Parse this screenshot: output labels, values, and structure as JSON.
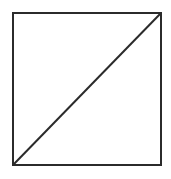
{
  "diagram": {
    "stroke_color": "#2b2b2b",
    "stroke_width": 2,
    "background": "#ffffff",
    "square": {
      "x": 13,
      "y": 13,
      "width": 148,
      "height": 152
    },
    "diagonal": {
      "x1": 13,
      "y1": 165,
      "x2": 161,
      "y2": 13
    }
  }
}
